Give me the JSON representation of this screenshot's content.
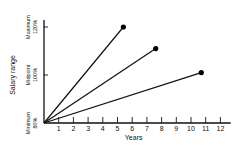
{
  "chart_data": {
    "type": "line",
    "title": "",
    "xlabel": "Years",
    "ylabel": "Salary range",
    "x_ticks": [
      "1",
      "2",
      "3",
      "4",
      "5",
      "6",
      "7",
      "8",
      "9",
      "10",
      "11",
      "12"
    ],
    "xlim": [
      0,
      12.7
    ],
    "ylim": [
      80,
      120
    ],
    "y_ticks": [
      {
        "value": 80,
        "label_top": "Minimum",
        "label_bottom": "80%"
      },
      {
        "value": 100,
        "label_top": "Midpoint",
        "label_bottom": "100%"
      },
      {
        "value": 120,
        "label_top": "Maximum",
        "label_bottom": "120%"
      }
    ],
    "grid": false,
    "legend": "none",
    "series": [
      {
        "name": "line-1",
        "points": [
          [
            0,
            80
          ],
          [
            5.4,
            120
          ]
        ]
      },
      {
        "name": "line-2",
        "points": [
          [
            0,
            80
          ],
          [
            7.6,
            111
          ]
        ]
      },
      {
        "name": "line-3",
        "points": [
          [
            0,
            80
          ],
          [
            10.7,
            101
          ]
        ]
      }
    ]
  }
}
